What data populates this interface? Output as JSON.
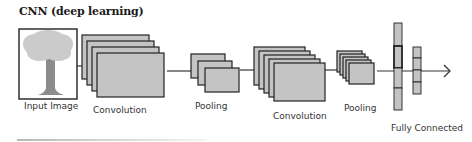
{
  "title": "CNN (deep learning)",
  "labels": {
    "input": "Input Image",
    "conv1": "Convolution",
    "pool1": "Pooling",
    "conv2": "Convolution",
    "pool2": "Pooling",
    "fc": "Fully Connected"
  },
  "colors": {
    "stroke": "#222222",
    "fill": "#c4c4c4",
    "canopy": "#cbcbcb",
    "trunk": "#8c8c8c"
  },
  "layers": [
    {
      "name": "conv1",
      "x": 82,
      "y": 35,
      "w": 67,
      "h": 44,
      "count": 4,
      "dx": 5,
      "dy": 6
    },
    {
      "name": "pool1",
      "x": 191,
      "y": 54,
      "w": 34,
      "h": 24,
      "count": 3,
      "dx": 7,
      "dy": 7
    },
    {
      "name": "conv2",
      "x": 254,
      "y": 47,
      "w": 51,
      "h": 38,
      "count": 5,
      "dx": 5,
      "dy": 4
    },
    {
      "name": "pool2",
      "x": 337,
      "y": 51,
      "w": 25,
      "h": 21,
      "count": 5,
      "dx": 3,
      "dy": 3
    }
  ],
  "fc": [
    {
      "x": 394,
      "w": 8,
      "segments": [
        [
          23,
          46
        ],
        [
          46,
          68
        ],
        [
          68,
          88
        ],
        [
          88,
          110
        ]
      ],
      "highlight": 1
    },
    {
      "x": 413,
      "w": 8,
      "segments": [
        [
          47,
          58
        ],
        [
          58,
          70
        ],
        [
          70,
          82
        ],
        [
          82,
          94
        ]
      ],
      "highlight": -1
    }
  ]
}
